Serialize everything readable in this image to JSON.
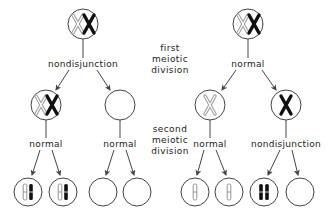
{
  "stage_labels": {
    "first": [
      "first",
      "meiotic",
      "division"
    ],
    "second": [
      "second",
      "meiotic",
      "division"
    ]
  },
  "left_tree": {
    "first_division_event": "nondisjunction",
    "second_division_events": [
      "normal",
      "normal"
    ],
    "parent": {
      "chromosomes": [
        "X-light",
        "X-dark"
      ]
    },
    "secondary": [
      {
        "chromosomes": [
          "X-light",
          "X-dark"
        ]
      },
      {
        "chromosomes": []
      }
    ],
    "gametes": [
      {
        "chromosomes": [
          "chromatid-light",
          "chromatid-dark"
        ]
      },
      {
        "chromosomes": [
          "chromatid-light",
          "chromatid-dark"
        ]
      },
      {
        "chromosomes": []
      },
      {
        "chromosomes": []
      }
    ]
  },
  "right_tree": {
    "first_division_event": "normal",
    "second_division_events": [
      "normal",
      "nondisjunction"
    ],
    "parent": {
      "chromosomes": [
        "X-light",
        "X-dark"
      ]
    },
    "secondary": [
      {
        "chromosomes": [
          "X-light"
        ]
      },
      {
        "chromosomes": [
          "X-dark"
        ]
      }
    ],
    "gametes": [
      {
        "chromosomes": [
          "chromatid-light"
        ]
      },
      {
        "chromosomes": [
          "chromatid-light"
        ]
      },
      {
        "chromosomes": [
          "chromatid-dark",
          "chromatid-dark"
        ]
      },
      {
        "chromosomes": []
      }
    ]
  },
  "colors": {
    "line": "#444444",
    "dark_chromosome": "#111111",
    "light_chromosome": "#9a9a9a"
  }
}
